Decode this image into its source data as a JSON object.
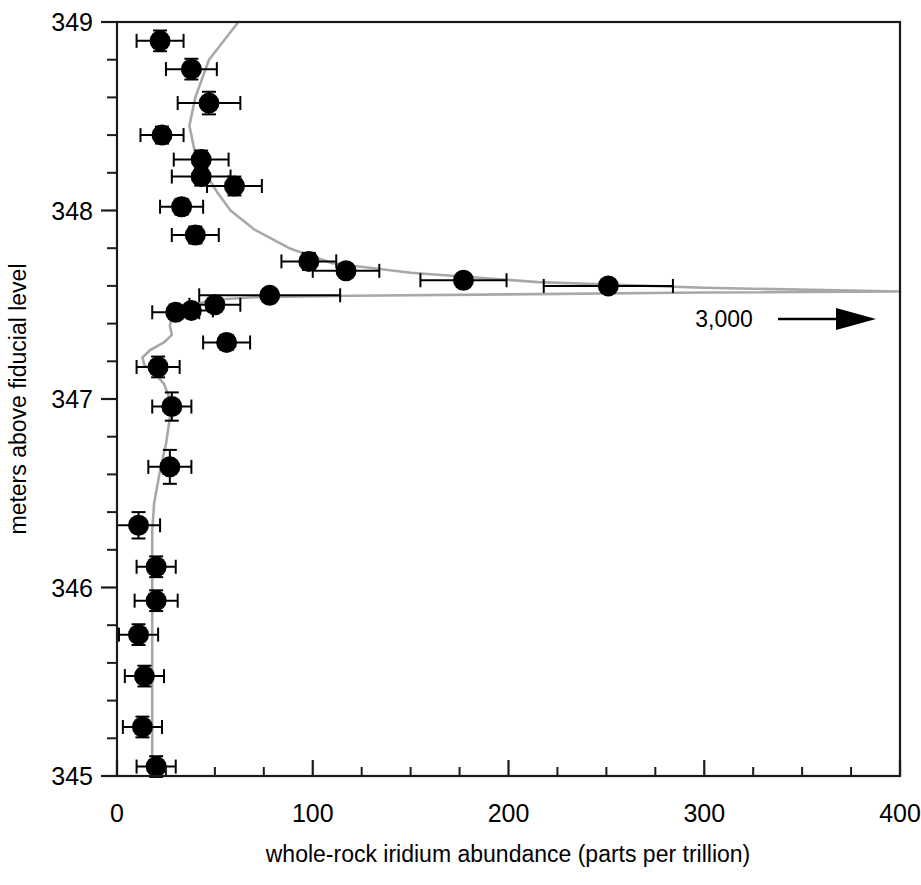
{
  "chart_data": {
    "type": "scatter",
    "title": "",
    "xlabel": "whole-rock iridium abundance (parts per trillion)",
    "ylabel": "meters above fiducial level",
    "xlim": [
      0,
      400
    ],
    "ylim": [
      345,
      349
    ],
    "xticks": [
      0,
      100,
      200,
      300,
      400
    ],
    "xticklabels": [
      "0",
      "100",
      "200",
      "300",
      "400"
    ],
    "xminor_step": 25,
    "yticks": [
      345,
      346,
      347,
      348,
      349
    ],
    "yticklabels": [
      "345",
      "346",
      "347",
      "348",
      "349"
    ],
    "yminor_step": 0.2,
    "grid": false,
    "legend": "none",
    "orientation": "x = iridium abundance (ppt), y = stratigraphic height (m)",
    "annotations": [
      {
        "text": "3,000",
        "x": 310,
        "y": 347.56,
        "arrow": "right",
        "meaning": "off-scale data point at 3,000 parts per trillion"
      }
    ],
    "series": [
      {
        "name": "whole-rock iridium measurements",
        "marker": "filled-circle",
        "color": "#000000",
        "error_bars": "x and y",
        "points": [
          {
            "x": 22,
            "y": 348.9,
            "xerr": 12,
            "yerr": 0.055
          },
          {
            "x": 38,
            "y": 348.75,
            "xerr": 13,
            "yerr": 0.055
          },
          {
            "x": 47,
            "y": 348.57,
            "xerr": 16,
            "yerr": 0.06
          },
          {
            "x": 23,
            "y": 348.4,
            "xerr": 11,
            "yerr": 0.045
          },
          {
            "x": 43,
            "y": 348.27,
            "xerr": 14,
            "yerr": 0.048
          },
          {
            "x": 43,
            "y": 348.18,
            "xerr": 15,
            "yerr": 0.048
          },
          {
            "x": 60,
            "y": 348.13,
            "xerr": 14,
            "yerr": 0.05
          },
          {
            "x": 33,
            "y": 348.02,
            "xerr": 11,
            "yerr": 0.042
          },
          {
            "x": 40,
            "y": 347.87,
            "xerr": 12,
            "yerr": 0.045
          },
          {
            "x": 98,
            "y": 347.73,
            "xerr": 14,
            "yerr": 0.045
          },
          {
            "x": 117,
            "y": 347.68,
            "xerr": 17,
            "yerr": 0.038
          },
          {
            "x": 177,
            "y": 347.63,
            "xerr": 22,
            "yerr": 0.03
          },
          {
            "x": 251,
            "y": 347.6,
            "xerr": 33,
            "yerr": 0.028
          },
          {
            "x": 78,
            "y": 347.55,
            "xerr": 36,
            "yerr": 0.022
          },
          {
            "x": 50,
            "y": 347.5,
            "xerr": 13,
            "yerr": 0.028
          },
          {
            "x": 38,
            "y": 347.47,
            "xerr": 11,
            "yerr": 0.03
          },
          {
            "x": 30,
            "y": 347.46,
            "xerr": 12,
            "yerr": 0.03
          },
          {
            "x": 56,
            "y": 347.3,
            "xerr": 12,
            "yerr": 0.04
          },
          {
            "x": 21,
            "y": 347.17,
            "xerr": 11,
            "yerr": 0.055
          },
          {
            "x": 28,
            "y": 346.96,
            "xerr": 10,
            "yerr": 0.075
          },
          {
            "x": 27,
            "y": 346.64,
            "xerr": 11,
            "yerr": 0.09
          },
          {
            "x": 11,
            "y": 346.33,
            "xerr": 11,
            "yerr": 0.07
          },
          {
            "x": 20,
            "y": 346.11,
            "xerr": 10,
            "yerr": 0.055
          },
          {
            "x": 20,
            "y": 345.93,
            "xerr": 11,
            "yerr": 0.055
          },
          {
            "x": 11,
            "y": 345.75,
            "xerr": 10,
            "yerr": 0.055
          },
          {
            "x": 14,
            "y": 345.53,
            "xerr": 10,
            "yerr": 0.055
          },
          {
            "x": 13,
            "y": 345.26,
            "xerr": 10,
            "yerr": 0.055
          },
          {
            "x": 20,
            "y": 345.05,
            "xerr": 10,
            "yerr": 0.055
          }
        ]
      }
    ],
    "fit_curve": {
      "name": "smoothed profile",
      "color": "#a8a8a8",
      "points": [
        {
          "x": 62,
          "y": 349.0
        },
        {
          "x": 47,
          "y": 348.8
        },
        {
          "x": 40,
          "y": 348.6
        },
        {
          "x": 37,
          "y": 348.45
        },
        {
          "x": 40,
          "y": 348.3
        },
        {
          "x": 45,
          "y": 348.2
        },
        {
          "x": 51,
          "y": 348.1
        },
        {
          "x": 58,
          "y": 348.0
        },
        {
          "x": 70,
          "y": 347.9
        },
        {
          "x": 88,
          "y": 347.8
        },
        {
          "x": 110,
          "y": 347.72
        },
        {
          "x": 150,
          "y": 347.67
        },
        {
          "x": 215,
          "y": 347.62
        },
        {
          "x": 300,
          "y": 347.59
        },
        {
          "x": 400,
          "y": 347.57
        },
        {
          "x": 300,
          "y": 347.565
        },
        {
          "x": 200,
          "y": 347.555
        },
        {
          "x": 120,
          "y": 347.548
        },
        {
          "x": 70,
          "y": 347.54
        },
        {
          "x": 48,
          "y": 347.525
        },
        {
          "x": 38,
          "y": 347.495
        },
        {
          "x": 32,
          "y": 347.465
        },
        {
          "x": 28,
          "y": 347.43
        },
        {
          "x": 27,
          "y": 347.39
        },
        {
          "x": 28,
          "y": 347.34
        },
        {
          "x": 24,
          "y": 347.3
        },
        {
          "x": 17,
          "y": 347.26
        },
        {
          "x": 13,
          "y": 347.22
        },
        {
          "x": 14,
          "y": 347.18
        },
        {
          "x": 19,
          "y": 347.14
        },
        {
          "x": 24,
          "y": 347.08
        },
        {
          "x": 27,
          "y": 347.0
        },
        {
          "x": 27,
          "y": 346.9
        },
        {
          "x": 25,
          "y": 346.76
        },
        {
          "x": 22,
          "y": 346.62
        },
        {
          "x": 19,
          "y": 346.45
        },
        {
          "x": 18,
          "y": 346.3
        },
        {
          "x": 18,
          "y": 346.1
        },
        {
          "x": 18,
          "y": 345.9
        },
        {
          "x": 18,
          "y": 345.7
        },
        {
          "x": 18,
          "y": 345.45
        },
        {
          "x": 18,
          "y": 345.2
        },
        {
          "x": 18,
          "y": 345.0
        }
      ]
    }
  },
  "figure": {
    "xaxis_title": "whole-rock iridium abundance (parts per trillion)",
    "yaxis_title": "meters above fiducial level",
    "x_tick_labels": [
      "0",
      "100",
      "200",
      "300",
      "400"
    ],
    "y_tick_labels": [
      "345",
      "346",
      "347",
      "348",
      "349"
    ],
    "offscale_label": "3,000"
  },
  "caption": {
    "text": "the above whole-rock iridium data of the field area."
  },
  "colors": {
    "axis": "#1a1a1a",
    "marker": "#000000",
    "fit_curve": "#a8a8a8",
    "background": "#ffffff"
  }
}
